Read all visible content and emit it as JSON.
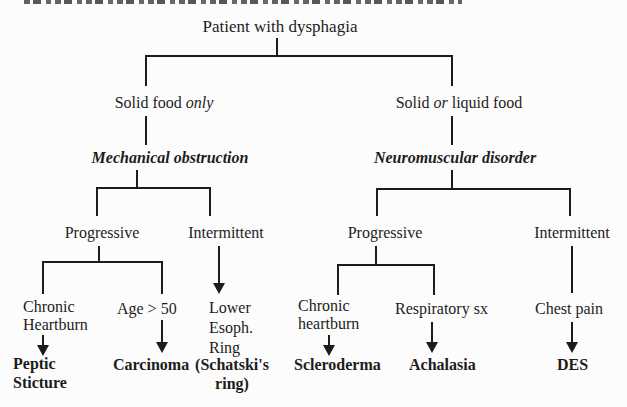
{
  "root_label": "Patient with dysphagia",
  "left": {
    "food": {
      "pre": "Solid food ",
      "em": "only",
      "post": ""
    },
    "disorder": "Mechanical obstruction",
    "course_progressive": "Progressive",
    "course_intermittent": "Intermittent",
    "leaves": [
      {
        "symptom": "Chronic\nHeartburn",
        "diagnosis": "Peptic\nSticture"
      },
      {
        "symptom": "Age > 50",
        "diagnosis": "Carcinoma"
      },
      {
        "symptom": "Lower\nEsoph.\nRing",
        "diagnosis": "(Schatski's\nring)"
      }
    ]
  },
  "right": {
    "food": {
      "pre": "Solid ",
      "em": "or",
      "post": " liquid food"
    },
    "disorder": "Neuromuscular disorder",
    "course_progressive": "Progressive",
    "course_intermittent": "Intermittent",
    "leaves": [
      {
        "symptom": "Chronic\nheartburn",
        "diagnosis": "Scleroderma"
      },
      {
        "symptom": "Respiratory sx",
        "diagnosis": "Achalasia"
      },
      {
        "symptom": "Chest pain",
        "diagnosis": "DES"
      }
    ]
  },
  "colors": {
    "ink": "#1c1c1c",
    "background": "#fcfcfc"
  }
}
